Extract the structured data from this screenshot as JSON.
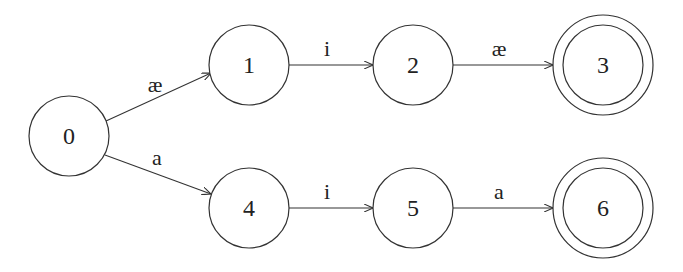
{
  "diagram": {
    "type": "finite-state-automaton",
    "nodes": [
      {
        "id": "0",
        "label": "0",
        "x": 69,
        "y": 136,
        "accepting": false
      },
      {
        "id": "1",
        "label": "1",
        "x": 249,
        "y": 65,
        "accepting": false
      },
      {
        "id": "2",
        "label": "2",
        "x": 413,
        "y": 65,
        "accepting": false
      },
      {
        "id": "3",
        "label": "3",
        "x": 603,
        "y": 65,
        "accepting": true
      },
      {
        "id": "4",
        "label": "4",
        "x": 249,
        "y": 208,
        "accepting": false
      },
      {
        "id": "5",
        "label": "5",
        "x": 413,
        "y": 208,
        "accepting": false
      },
      {
        "id": "6",
        "label": "6",
        "x": 603,
        "y": 208,
        "accepting": true
      }
    ],
    "edges": [
      {
        "from": "0",
        "to": "1",
        "label": "æ"
      },
      {
        "from": "1",
        "to": "2",
        "label": "i"
      },
      {
        "from": "2",
        "to": "3",
        "label": "æ"
      },
      {
        "from": "0",
        "to": "4",
        "label": "a"
      },
      {
        "from": "4",
        "to": "5",
        "label": "i"
      },
      {
        "from": "5",
        "to": "6",
        "label": "a"
      }
    ]
  }
}
